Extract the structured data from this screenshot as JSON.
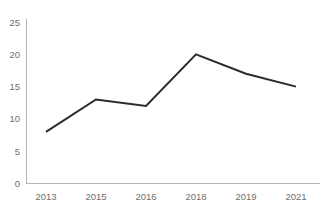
{
  "chart_data": {
    "type": "line",
    "title": "",
    "subtitle": "",
    "xlabel": "",
    "ylabel": "",
    "categories": [
      "2013",
      "2015",
      "2016",
      "2018",
      "2019",
      "2021"
    ],
    "values": [
      8,
      13,
      12,
      20,
      17,
      15
    ],
    "series": [
      {
        "name": "",
        "values": [
          8,
          13,
          12,
          20,
          17,
          15
        ]
      }
    ],
    "ylim": [
      0,
      25
    ],
    "yticks": [
      "0",
      "5",
      "10",
      "15",
      "20",
      "25"
    ],
    "ytick_values": [
      0,
      5,
      10,
      15,
      20,
      25
    ],
    "xticks": [
      "2013",
      "2015",
      "2016",
      "2018",
      "2019",
      "2021"
    ],
    "grid": false,
    "legend": false,
    "legend_position": "none",
    "markers": false,
    "annotations": [],
    "colors": {
      "line": "#2b2b2b",
      "axis": "#b6b6b6",
      "tick_text": "#6e6e6e",
      "background": "#ffffff"
    }
  }
}
